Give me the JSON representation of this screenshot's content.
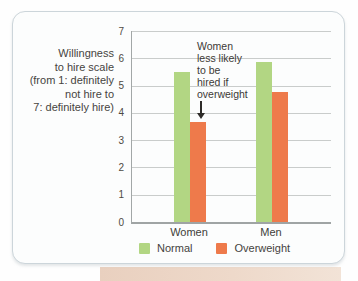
{
  "figure": {
    "axis_label": "Willingness\nto hire scale\n(from 1: definitely\nnot hire to\n7: definitely hire)",
    "annotation_text": "Women\nless likely\nto be\nhired if\noverweight"
  },
  "chart_data": {
    "type": "bar",
    "categories": [
      "Women",
      "Men"
    ],
    "series": [
      {
        "name": "Normal",
        "color": "#b2d683",
        "values": [
          5.5,
          5.85
        ]
      },
      {
        "name": "Overweight",
        "color": "#ee7a4b",
        "values": [
          3.65,
          4.75
        ]
      }
    ],
    "title": "",
    "xlabel": "",
    "ylabel": "Willingness to hire scale (from 1: definitely not hire to 7: definitely hire)",
    "ylim": [
      0,
      7
    ],
    "yticks": [
      0,
      1,
      2,
      3,
      4,
      5,
      6,
      7
    ],
    "grid": true,
    "legend_position": "bottom",
    "annotations": [
      {
        "text": "Women less likely to be hired if overweight",
        "points_to": {
          "category": "Women",
          "series": "Overweight"
        }
      }
    ]
  },
  "colors": {
    "normal_bar": "#b2d683",
    "overweight_bar": "#ee7a4b",
    "gridline": "#c9cccb",
    "axis": "#a2a7a7",
    "card_border": "#ccd5da",
    "card_background": "#fcfdfd",
    "bottom_strip": "#e9d0bf",
    "text": "#46443f",
    "arrow": "#2e2c29"
  }
}
